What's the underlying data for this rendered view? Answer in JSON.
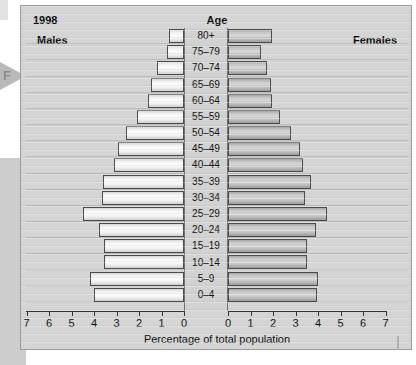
{
  "figure": {
    "year_label": "1998",
    "age_header": "Age",
    "males_label": "Males",
    "females_label": "Females",
    "axis_title": "Percentage of total population",
    "margin_marker": "F"
  },
  "colors": {
    "figure_background": "#d5d5d5",
    "male_bar": "#f2f2f2",
    "female_bar": "#c9c9c9",
    "bar_outline": "#4b4b4b",
    "center_band": "#d2d2d2",
    "page_background": "#ffffff",
    "side_block": "#cdcdcd"
  },
  "chart_data": {
    "type": "bar",
    "subtype": "population-pyramid",
    "title": "1998",
    "xlabel": "Percentage of total population",
    "ylabel": "Age",
    "xlim": [
      0,
      7
    ],
    "xticks": [
      0,
      1,
      2,
      3,
      4,
      5,
      6,
      7
    ],
    "xtick_labels": [
      "0",
      "1",
      "2",
      "3",
      "4",
      "5",
      "6",
      "7"
    ],
    "grid": true,
    "legend_position": "inline-top-corners",
    "categories": [
      "80+",
      "75–79",
      "70–74",
      "65–69",
      "60–64",
      "55–59",
      "50–54",
      "45–49",
      "40–44",
      "35–39",
      "30–34",
      "25–29",
      "20–24",
      "15–19",
      "10–14",
      "5–9",
      "0–4"
    ],
    "series": [
      {
        "name": "Males",
        "side": "left",
        "values": [
          0.65,
          0.75,
          1.2,
          1.45,
          1.6,
          2.1,
          2.6,
          2.95,
          3.1,
          3.6,
          3.65,
          4.5,
          3.8,
          3.55,
          3.55,
          4.2,
          4.0
        ]
      },
      {
        "name": "Females",
        "side": "right",
        "values": [
          1.95,
          1.45,
          1.75,
          1.9,
          1.95,
          2.3,
          2.8,
          3.2,
          3.35,
          3.7,
          3.4,
          4.4,
          3.9,
          3.5,
          3.5,
          4.0,
          3.95
        ]
      }
    ]
  }
}
